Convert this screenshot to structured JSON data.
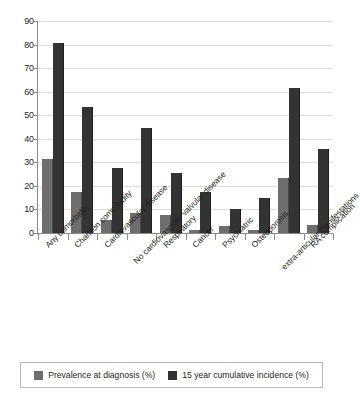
{
  "chart_data": {
    "type": "bar",
    "title": "",
    "subtitle": "",
    "xlabel": "",
    "ylabel": "",
    "ylim": [
      0,
      90
    ],
    "y_ticks": [
      0,
      10,
      20,
      30,
      40,
      50,
      60,
      70,
      80,
      90
    ],
    "grid": true,
    "legend_position": "bottom",
    "categories": [
      "Any comorbidity",
      "Charlson comorbidity",
      "Cardiovascular disease",
      "No cardiovascular valvular disease",
      "Respiratory",
      "Cancer",
      "Psychiatric",
      "Osteoporosis",
      "extra-articular manifestations",
      "RA complication"
    ],
    "series": [
      {
        "name": "Prevalence at diagnosis (%)",
        "color": "#6e6e6e",
        "values": [
          31.5,
          17.5,
          5.5,
          8.5,
          7.5,
          1.5,
          3.0,
          1.5,
          23.5,
          3.5
        ]
      },
      {
        "name": "15 year cumulative incidence (%)",
        "color": "#333333",
        "values": [
          80.5,
          53.5,
          27.5,
          44.5,
          25.5,
          17.5,
          10.0,
          15.0,
          61.5,
          35.5
        ]
      }
    ]
  },
  "legend": {
    "items": [
      {
        "label": "Prevalence at diagnosis (%)",
        "swatch": "legend-swatch-prevalence"
      },
      {
        "label": "15 year cumulative incidence (%)",
        "swatch": "legend-swatch-incidence"
      }
    ]
  },
  "axis": {
    "y_tick_labels": [
      "0",
      "10",
      "20",
      "30",
      "40",
      "50",
      "60",
      "70",
      "80",
      "90"
    ]
  }
}
